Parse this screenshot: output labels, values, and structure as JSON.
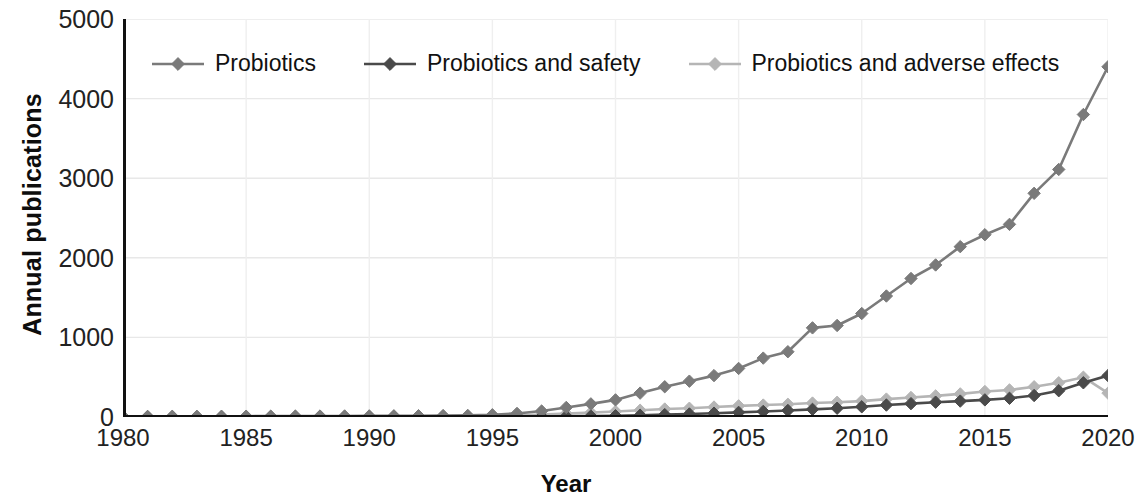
{
  "chart_data": {
    "type": "line",
    "title": "",
    "xlabel": "Year",
    "ylabel": "Annual publications",
    "xlim": [
      1980,
      2020
    ],
    "ylim": [
      0,
      5000
    ],
    "yticks": [
      0,
      1000,
      2000,
      3000,
      4000,
      5000
    ],
    "xticks": [
      1980,
      1985,
      1990,
      1995,
      2000,
      2005,
      2010,
      2015,
      2020
    ],
    "grid": true,
    "legend_position": "top-left-inside",
    "marker": "diamond",
    "x": [
      1980,
      1981,
      1982,
      1983,
      1984,
      1985,
      1986,
      1987,
      1988,
      1989,
      1990,
      1991,
      1992,
      1993,
      1994,
      1995,
      1996,
      1997,
      1998,
      1999,
      2000,
      2001,
      2002,
      2003,
      2004,
      2005,
      2006,
      2007,
      2008,
      2009,
      2010,
      2011,
      2012,
      2013,
      2014,
      2015,
      2016,
      2017,
      2018,
      2019,
      2020
    ],
    "series": [
      {
        "name": "Probiotics",
        "color": "#7a7a7a",
        "values": [
          8,
          8,
          9,
          9,
          10,
          10,
          11,
          12,
          12,
          13,
          14,
          15,
          16,
          18,
          20,
          28,
          45,
          75,
          120,
          165,
          215,
          300,
          380,
          450,
          520,
          610,
          740,
          820,
          1120,
          1150,
          1300,
          1520,
          1740,
          1910,
          2140,
          2290,
          2420,
          2810,
          3110,
          3800,
          4400
        ]
      },
      {
        "name": "Probiotics and safety",
        "color": "#4a4a4a",
        "values": [
          1,
          1,
          1,
          1,
          1,
          1,
          1,
          1,
          1,
          1,
          2,
          2,
          2,
          2,
          3,
          3,
          4,
          6,
          9,
          12,
          16,
          22,
          30,
          38,
          48,
          58,
          70,
          82,
          96,
          110,
          128,
          150,
          168,
          186,
          200,
          215,
          235,
          270,
          330,
          430,
          520
        ]
      },
      {
        "name": "Probiotics and adverse effects",
        "color": "#b5b5b5",
        "values": [
          2,
          2,
          2,
          2,
          3,
          3,
          3,
          4,
          4,
          5,
          5,
          6,
          7,
          8,
          10,
          14,
          20,
          30,
          42,
          55,
          70,
          85,
          100,
          110,
          125,
          140,
          150,
          160,
          175,
          185,
          200,
          225,
          245,
          265,
          290,
          320,
          340,
          380,
          430,
          500,
          300
        ]
      }
    ]
  },
  "legend": {
    "items": [
      {
        "label": "Probiotics",
        "color": "#7a7a7a"
      },
      {
        "label": "Probiotics and safety",
        "color": "#4a4a4a"
      },
      {
        "label": "Probiotics and adverse effects",
        "color": "#b5b5b5"
      }
    ]
  },
  "axes": {
    "y_title": "Annual publications",
    "x_title": "Year",
    "y_tick_labels": [
      "5000",
      "4000",
      "3000",
      "2000",
      "1000",
      "0"
    ],
    "x_tick_labels": [
      "1980",
      "1985",
      "1990",
      "1995",
      "2000",
      "2005",
      "2010",
      "2015",
      "2020"
    ]
  },
  "style": {
    "axis_color": "#111111",
    "grid_color": "#e8e8e8",
    "background": "#ffffff"
  }
}
